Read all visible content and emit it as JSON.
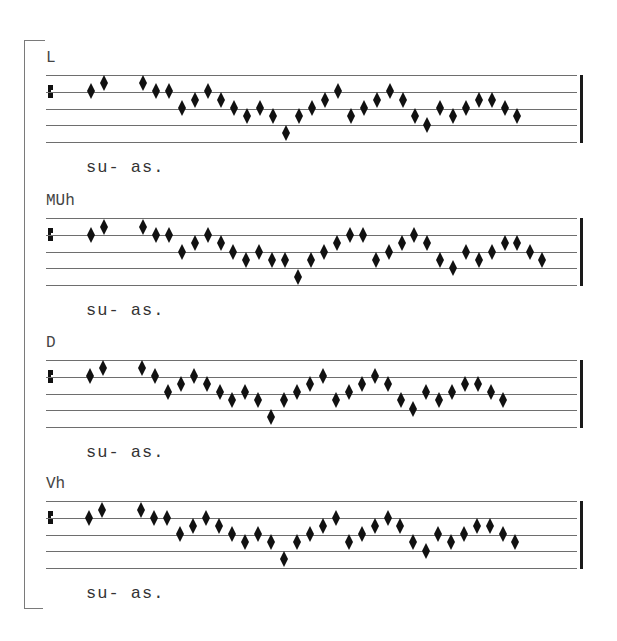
{
  "bracket": {
    "top": 40,
    "bottom": 608
  },
  "staff_style": {
    "line_spacing": 16.75,
    "line_color": "#6e6e6e",
    "note_color": "#111111",
    "clef": "C-clef on line 2"
  },
  "systems": [
    {
      "label": "L",
      "lyric": "su- as.",
      "top": 75,
      "notes": [
        [
          91,
          91
        ],
        [
          104,
          83
        ],
        [
          143,
          83
        ],
        [
          156,
          91
        ],
        [
          169,
          91
        ],
        [
          182,
          108
        ],
        [
          195,
          100
        ],
        [
          208,
          91
        ],
        [
          221,
          100
        ],
        [
          234,
          108
        ],
        [
          247,
          116
        ],
        [
          260,
          108
        ],
        [
          273,
          116
        ],
        [
          286,
          133
        ],
        [
          299,
          116
        ],
        [
          312,
          108
        ],
        [
          325,
          100
        ],
        [
          338,
          91
        ],
        [
          351,
          116
        ],
        [
          364,
          108
        ],
        [
          377,
          100
        ],
        [
          390,
          91
        ],
        [
          403,
          100
        ],
        [
          415,
          116
        ],
        [
          427,
          125
        ],
        [
          440,
          108
        ],
        [
          453,
          116
        ],
        [
          466,
          108
        ],
        [
          479,
          100
        ],
        [
          492,
          100
        ],
        [
          505,
          108
        ],
        [
          517,
          116
        ]
      ]
    },
    {
      "label": "MUh",
      "lyric": "su- as.",
      "top": 218,
      "notes": [
        [
          91,
          235
        ],
        [
          104,
          227
        ],
        [
          143,
          227
        ],
        [
          156,
          235
        ],
        [
          169,
          235
        ],
        [
          182,
          252
        ],
        [
          195,
          243
        ],
        [
          208,
          235
        ],
        [
          221,
          243
        ],
        [
          233,
          252
        ],
        [
          246,
          260
        ],
        [
          259,
          252
        ],
        [
          272,
          260
        ],
        [
          285,
          260
        ],
        [
          298,
          277
        ],
        [
          311,
          260
        ],
        [
          324,
          252
        ],
        [
          337,
          243
        ],
        [
          350,
          235
        ],
        [
          363,
          235
        ],
        [
          376,
          260
        ],
        [
          389,
          252
        ],
        [
          402,
          243
        ],
        [
          414,
          235
        ],
        [
          427,
          243
        ],
        [
          440,
          260
        ],
        [
          453,
          268
        ],
        [
          466,
          252
        ],
        [
          479,
          260
        ],
        [
          492,
          252
        ],
        [
          505,
          243
        ],
        [
          517,
          243
        ],
        [
          530,
          252
        ],
        [
          542,
          260
        ]
      ]
    },
    {
      "label": "D",
      "lyric": "su- as.",
      "top": 360,
      "notes": [
        [
          90,
          376
        ],
        [
          103,
          368
        ],
        [
          142,
          368
        ],
        [
          155,
          376
        ],
        [
          168,
          392
        ],
        [
          181,
          384
        ],
        [
          194,
          376
        ],
        [
          207,
          384
        ],
        [
          220,
          392
        ],
        [
          232,
          400
        ],
        [
          245,
          392
        ],
        [
          258,
          400
        ],
        [
          271,
          417
        ],
        [
          284,
          400
        ],
        [
          297,
          392
        ],
        [
          310,
          384
        ],
        [
          323,
          376
        ],
        [
          336,
          400
        ],
        [
          349,
          392
        ],
        [
          362,
          384
        ],
        [
          375,
          376
        ],
        [
          388,
          384
        ],
        [
          401,
          400
        ],
        [
          413,
          409
        ],
        [
          426,
          392
        ],
        [
          439,
          400
        ],
        [
          452,
          392
        ],
        [
          465,
          384
        ],
        [
          478,
          384
        ],
        [
          491,
          392
        ],
        [
          503,
          400
        ]
      ]
    },
    {
      "label": "Vh",
      "lyric": "su- as.",
      "top": 501,
      "notes": [
        [
          89,
          518
        ],
        [
          102,
          510
        ],
        [
          141,
          510
        ],
        [
          154,
          518
        ],
        [
          167,
          518
        ],
        [
          180,
          534
        ],
        [
          193,
          526
        ],
        [
          206,
          518
        ],
        [
          219,
          526
        ],
        [
          232,
          534
        ],
        [
          245,
          542
        ],
        [
          258,
          534
        ],
        [
          271,
          542
        ],
        [
          284,
          559
        ],
        [
          297,
          542
        ],
        [
          310,
          534
        ],
        [
          323,
          526
        ],
        [
          336,
          518
        ],
        [
          349,
          542
        ],
        [
          362,
          534
        ],
        [
          375,
          526
        ],
        [
          388,
          518
        ],
        [
          400,
          526
        ],
        [
          413,
          542
        ],
        [
          426,
          551
        ],
        [
          438,
          534
        ],
        [
          451,
          542
        ],
        [
          464,
          534
        ],
        [
          477,
          526
        ],
        [
          490,
          526
        ],
        [
          503,
          534
        ],
        [
          515,
          542
        ]
      ]
    }
  ]
}
